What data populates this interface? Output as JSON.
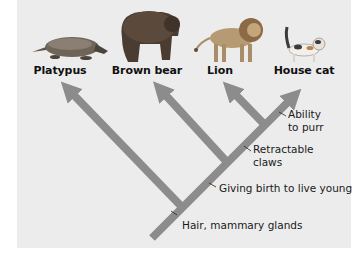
{
  "diagram": {
    "type": "cladogram",
    "colors": {
      "background": "#ececec",
      "branch": "#8c8c8c",
      "text": "#111111"
    },
    "taxa": [
      {
        "label": "Platypus",
        "icon": "platypus-illustration"
      },
      {
        "label": "Brown bear",
        "icon": "brown-bear-illustration"
      },
      {
        "label": "Lion",
        "icon": "lion-illustration"
      },
      {
        "label": "House cat",
        "icon": "house-cat-illustration"
      }
    ],
    "traits": [
      {
        "label": "Hair, mammary glands"
      },
      {
        "label": "Giving birth to live young"
      },
      {
        "label_line1": "Retractable",
        "label_line2": "claws"
      },
      {
        "label_line1": "Ability",
        "label_line2": "to purr"
      }
    ]
  }
}
